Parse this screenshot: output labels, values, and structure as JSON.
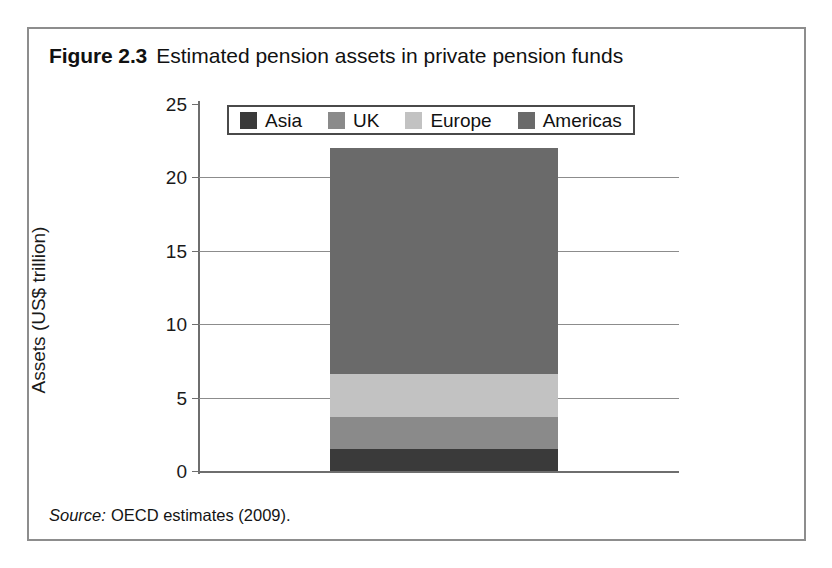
{
  "figure": {
    "caption_label": "Figure 2.3",
    "caption_text": "Estimated pension assets in private pension funds",
    "source_label": "Source:",
    "source_text": "OECD estimates (2009)."
  },
  "chart_data": {
    "type": "bar",
    "subtype": "stacked-bar-single-category",
    "title": "Estimated pension assets in private pension funds",
    "xlabel": "",
    "ylabel": "Assets (US$ trillion)",
    "ylim": [
      0,
      25
    ],
    "yticks": [
      0,
      5,
      10,
      15,
      20,
      25
    ],
    "ytick_labels": [
      "0",
      "5",
      "10",
      "15",
      "20",
      "25"
    ],
    "grid": true,
    "grid_axis": "y",
    "legend_position": "top-center",
    "categories": [
      ""
    ],
    "total": 22.0,
    "series": [
      {
        "name": "Asia",
        "values": [
          1.5
        ],
        "color": "#3a3a3a"
      },
      {
        "name": "UK",
        "values": [
          2.2
        ],
        "color": "#8a8a8a"
      },
      {
        "name": "Europe",
        "values": [
          2.9
        ],
        "color": "#c2c2c2"
      },
      {
        "name": "Americas",
        "values": [
          15.4
        ],
        "color": "#6a6a6a"
      }
    ],
    "stack_boundaries": [
      0,
      1.5,
      3.7,
      6.6,
      22.0
    ]
  },
  "legend": {
    "entries": [
      {
        "label": "Asia",
        "color": "#3a3a3a"
      },
      {
        "label": "UK",
        "color": "#8a8a8a"
      },
      {
        "label": "Europe",
        "color": "#c2c2c2"
      },
      {
        "label": "Americas",
        "color": "#6a6a6a"
      }
    ]
  }
}
